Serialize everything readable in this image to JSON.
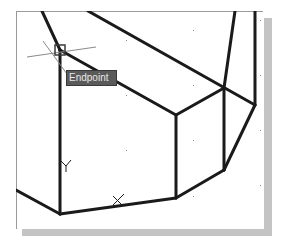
{
  "viewport": {
    "background": "#ffffff",
    "line_color": "#1a1a1a"
  },
  "osnap": {
    "tooltip_label": "Endpoint",
    "marker": "endpoint-square",
    "position": [
      60,
      50
    ]
  },
  "ucs_icon": {
    "y_label": "Y",
    "x_label": "X"
  },
  "cursor": {
    "type": "crosshair",
    "position": [
      55,
      53
    ]
  },
  "geometry": {
    "edges": [
      [
        [
          42,
          11
        ],
        [
          60,
          50
        ]
      ],
      [
        [
          60,
          50
        ],
        [
          60,
          214
        ]
      ],
      [
        [
          60,
          50
        ],
        [
          176,
          115
        ]
      ],
      [
        [
          88,
          11
        ],
        [
          255,
          105
        ]
      ],
      [
        [
          235,
          11
        ],
        [
          224,
          88
        ]
      ],
      [
        [
          255,
          11
        ],
        [
          255,
          105
        ]
      ],
      [
        [
          176,
          115
        ],
        [
          224,
          88
        ]
      ],
      [
        [
          176,
          115
        ],
        [
          176,
          198
        ]
      ],
      [
        [
          224,
          88
        ],
        [
          224,
          170
        ]
      ],
      [
        [
          255,
          105
        ],
        [
          224,
          170
        ]
      ],
      [
        [
          224,
          170
        ],
        [
          176,
          198
        ]
      ],
      [
        [
          176,
          198
        ],
        [
          60,
          214
        ]
      ],
      [
        [
          16,
          190
        ],
        [
          60,
          214
        ]
      ]
    ]
  }
}
